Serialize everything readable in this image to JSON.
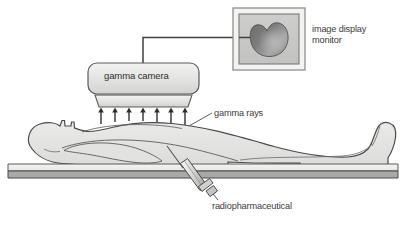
{
  "diagram": {
    "labels": {
      "monitor_line1": "image display",
      "monitor_line2": "monitor",
      "gamma_camera": "gamma camera",
      "gamma_rays": "gamma rays",
      "radiopharmaceutical": "radiopharmaceutical"
    },
    "components": {
      "monitor": {
        "name": "image display monitor",
        "screen_content": "heart shaped organ scan image"
      },
      "camera": {
        "name": "gamma camera",
        "detector_block": "collimator detector head"
      },
      "rays": {
        "name": "gamma rays",
        "arrow_count": 7,
        "direction": "upward"
      },
      "patient": {
        "name": "supine patient",
        "orientation": "head at left, feet at right"
      },
      "table": {
        "name": "examination table"
      },
      "syringe": {
        "name": "syringe injecting radiopharmaceutical"
      },
      "cable": {
        "name": "cable from gamma camera to monitor"
      }
    },
    "colors": {
      "outline": "#4a4a4a",
      "body_fill": "#e4e4e2",
      "body_fill_dark": "#d6d6d4",
      "device_fill": "#e8e8e6",
      "screen_fill": "#c9c9c7",
      "organ_dark": "#6e6e6e",
      "organ_light": "#b4b4b4",
      "table_top": "#efefed",
      "table_edge": "#a9a9a7",
      "text": "#3b3b3b"
    }
  }
}
